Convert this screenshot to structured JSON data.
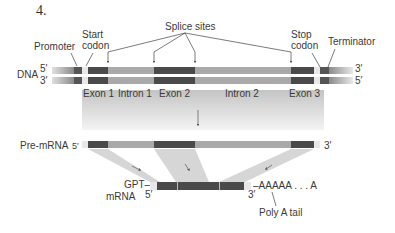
{
  "figure": {
    "number": "4."
  },
  "labels": {
    "promoter": "Promoter",
    "start_codon_line1": "Start",
    "start_codon_line2": "codon",
    "splice_sites": "Splice sites",
    "stop_codon_line1": "Stop",
    "stop_codon_line2": "codon",
    "terminator": "Terminator",
    "dna": "DNA",
    "dna_top_left": "5′",
    "dna_bottom_left": "3′",
    "dna_top_right": "3′",
    "dna_bottom_right": "5′",
    "exon1": "Exon 1",
    "intron1": "Intron 1",
    "exon2": "Exon 2",
    "intron2": "Intron 2",
    "exon3": "Exon 3",
    "pre_mrna": "Pre-mRNA",
    "pre_mrna_5": "5′",
    "pre_mrna_3": "3′",
    "gpt_mrna_line1": "GPT–",
    "gpt_mrna_line2": "mRNA",
    "mrna_5": "5′",
    "mrna_3": "3′",
    "poly_a_seq": "–AAAAA . . . A",
    "poly_a_tail": "Poly A tail"
  },
  "colors": {
    "exon": "#4a4a4a",
    "intron": "#a9a9a9",
    "promoter_dark": "#555555",
    "light_gap": "#e6e6e6",
    "shade": "#d6d6d6"
  }
}
